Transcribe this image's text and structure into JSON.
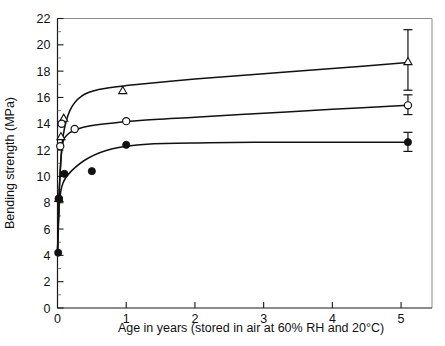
{
  "chart_data": {
    "type": "scatter",
    "title": "",
    "xlabel": "Age in years (stored in air at 60% RH and 20°C)",
    "ylabel": "Bending strength (MPa)",
    "xlim": [
      0,
      5.45
    ],
    "ylim": [
      0,
      22
    ],
    "xticks": [
      "0",
      "1",
      "2",
      "3",
      "4",
      "5"
    ],
    "xtick_values": [
      0,
      1,
      2,
      3,
      4,
      5
    ],
    "yticks": [
      "0",
      "2",
      "4",
      "6",
      "8",
      "10",
      "12",
      "14",
      "16",
      "18",
      "20",
      "22"
    ],
    "ytick_values": [
      0,
      2,
      4,
      6,
      8,
      10,
      12,
      14,
      16,
      18,
      20,
      22
    ],
    "grid": false,
    "legend": "none",
    "series": [
      {
        "name": "triangle-series",
        "marker": "open-triangle",
        "points": [
          {
            "x": 0.02,
            "y": 8.3
          },
          {
            "x": 0.05,
            "y": 13.0
          },
          {
            "x": 0.09,
            "y": 14.4
          },
          {
            "x": 0.95,
            "y": 16.5
          },
          {
            "x": 5.1,
            "y": 18.7
          }
        ],
        "curve": [
          {
            "x": 0.0,
            "y": 4.2
          },
          {
            "x": 0.03,
            "y": 9.5
          },
          {
            "x": 0.08,
            "y": 13.0
          },
          {
            "x": 0.18,
            "y": 15.0
          },
          {
            "x": 0.35,
            "y": 16.1
          },
          {
            "x": 0.6,
            "y": 16.6
          },
          {
            "x": 1.0,
            "y": 16.9
          },
          {
            "x": 2.0,
            "y": 17.4
          },
          {
            "x": 3.0,
            "y": 17.8
          },
          {
            "x": 4.0,
            "y": 18.2
          },
          {
            "x": 5.1,
            "y": 18.65
          }
        ],
        "error_bar": {
          "x": 5.1,
          "y": 18.7,
          "low": 16.55,
          "high": 21.15
        }
      },
      {
        "name": "open-circle-series",
        "marker": "open-circle",
        "points": [
          {
            "x": 0.02,
            "y": 8.3
          },
          {
            "x": 0.04,
            "y": 12.3
          },
          {
            "x": 0.06,
            "y": 14.0
          },
          {
            "x": 0.25,
            "y": 13.6
          },
          {
            "x": 1.0,
            "y": 14.2
          },
          {
            "x": 5.1,
            "y": 15.4
          }
        ],
        "curve": [
          {
            "x": 0.0,
            "y": 4.2
          },
          {
            "x": 0.03,
            "y": 9.3
          },
          {
            "x": 0.07,
            "y": 12.3
          },
          {
            "x": 0.15,
            "y": 13.2
          },
          {
            "x": 0.35,
            "y": 13.7
          },
          {
            "x": 0.7,
            "y": 14.0
          },
          {
            "x": 1.2,
            "y": 14.25
          },
          {
            "x": 2.0,
            "y": 14.5
          },
          {
            "x": 3.0,
            "y": 14.8
          },
          {
            "x": 4.0,
            "y": 15.1
          },
          {
            "x": 5.1,
            "y": 15.4
          }
        ],
        "error_bar": {
          "x": 5.1,
          "y": 15.4,
          "low": 14.7,
          "high": 16.2
        }
      },
      {
        "name": "filled-circle-series",
        "marker": "filled-circle",
        "points": [
          {
            "x": 0.01,
            "y": 4.2
          },
          {
            "x": 0.02,
            "y": 8.3
          },
          {
            "x": 0.1,
            "y": 10.2
          },
          {
            "x": 0.5,
            "y": 10.4
          },
          {
            "x": 1.0,
            "y": 12.4
          },
          {
            "x": 5.1,
            "y": 12.6
          }
        ],
        "curve": [
          {
            "x": 0.0,
            "y": 4.2
          },
          {
            "x": 0.03,
            "y": 8.1
          },
          {
            "x": 0.08,
            "y": 9.5
          },
          {
            "x": 0.2,
            "y": 10.4
          },
          {
            "x": 0.45,
            "y": 11.4
          },
          {
            "x": 0.8,
            "y": 12.1
          },
          {
            "x": 1.3,
            "y": 12.45
          },
          {
            "x": 2.2,
            "y": 12.55
          },
          {
            "x": 3.2,
            "y": 12.6
          },
          {
            "x": 4.2,
            "y": 12.6
          },
          {
            "x": 5.1,
            "y": 12.6
          }
        ],
        "error_bar": {
          "x": 5.1,
          "y": 12.6,
          "low": 11.9,
          "high": 13.35
        }
      }
    ],
    "colors": {
      "ink": "#111111",
      "frame": "#8d8d8d",
      "background": "#ffffff"
    }
  }
}
